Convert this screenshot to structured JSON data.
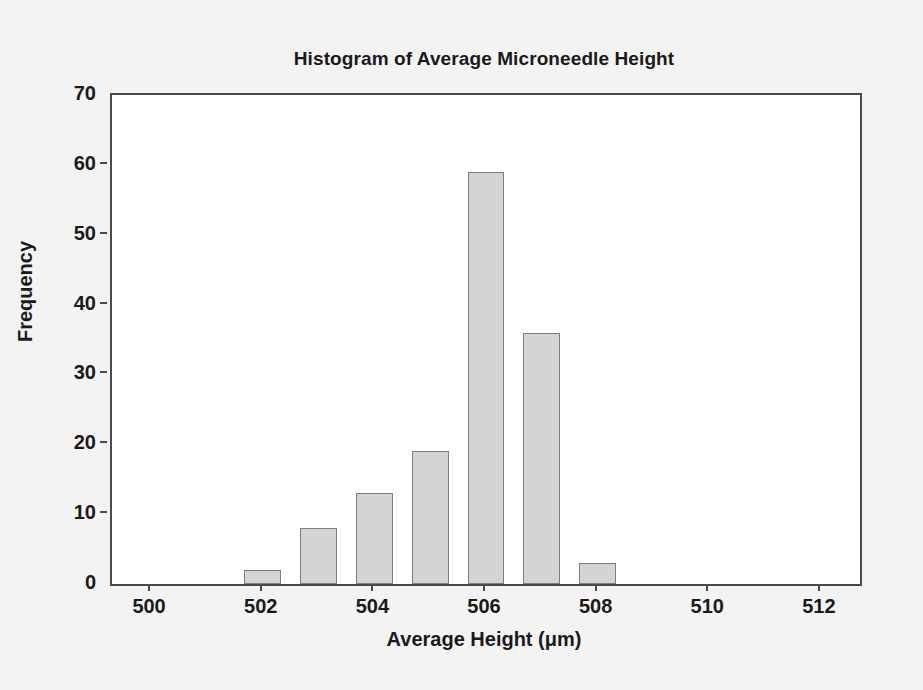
{
  "chart_data": {
    "type": "bar",
    "title": "Histogram of Average Microneedle Height",
    "xlabel": "Average Height (μm)",
    "ylabel": "Frequency",
    "categories": [
      500,
      501,
      502,
      503,
      504,
      505,
      506,
      507,
      508,
      509,
      510,
      511,
      512
    ],
    "values": [
      0,
      0,
      2,
      8,
      13,
      19,
      59,
      36,
      3,
      0,
      0,
      0,
      0
    ],
    "bars": [
      {
        "x": 502,
        "value": 2
      },
      {
        "x": 503,
        "value": 8
      },
      {
        "x": 504,
        "value": 13
      },
      {
        "x": 505,
        "value": 19
      },
      {
        "x": 506,
        "value": 59
      },
      {
        "x": 507,
        "value": 36
      },
      {
        "x": 508,
        "value": 3
      }
    ],
    "xlim": [
      499.3,
      512.7
    ],
    "ylim": [
      0,
      70
    ],
    "xticks": [
      500,
      502,
      504,
      506,
      508,
      510,
      512
    ],
    "xtick_labels": [
      "500",
      "502",
      "504",
      "506",
      "508",
      "510",
      "512"
    ],
    "yticks": [
      0,
      10,
      20,
      30,
      40,
      50,
      60,
      70
    ],
    "ytick_labels": [
      "0",
      "10",
      "20",
      "30",
      "40",
      "50",
      "60",
      "70"
    ],
    "grid": false,
    "legend": null,
    "bar_fill_color": "#d4d4d4",
    "bar_border_color": "#7d7d7d",
    "axis_color": "#4a4a4a",
    "plot_background": "#ffffff",
    "figure_background": "#f3f3f3"
  }
}
